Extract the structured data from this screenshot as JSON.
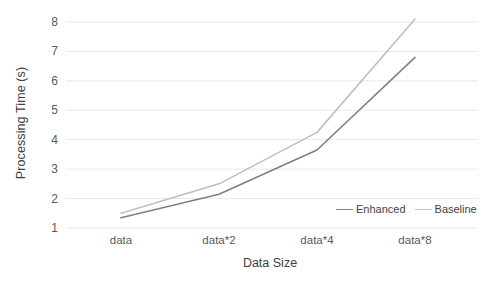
{
  "chart_data": {
    "type": "line",
    "title": "",
    "xlabel": "Data Size",
    "ylabel": "Processing Time (s)",
    "categories": [
      "data",
      "data*2",
      "data*4",
      "data*8"
    ],
    "series": [
      {
        "name": "Enhanced",
        "values": [
          1.35,
          2.15,
          3.65,
          6.8
        ],
        "color": "#808080"
      },
      {
        "name": "Baseline",
        "values": [
          1.5,
          2.5,
          4.25,
          8.1
        ],
        "color": "#bfbfbf"
      }
    ],
    "yticks": [
      1,
      2,
      3,
      4,
      5,
      6,
      7,
      8
    ],
    "ylim": [
      1,
      8
    ],
    "grid": true,
    "grid_color": "#e8e8e8",
    "legend_position": "bottom-right-inside",
    "tick_label_color": "#595959",
    "axis_title_color": "#404040",
    "background": "#ffffff"
  }
}
